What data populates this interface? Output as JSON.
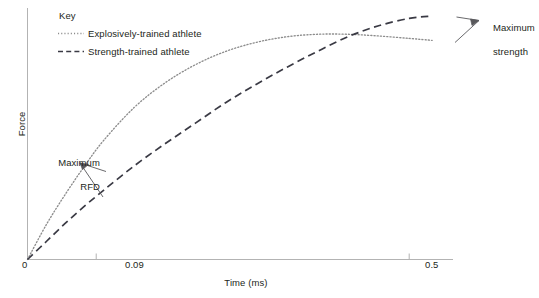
{
  "chart_data": {
    "type": "line",
    "title": "",
    "xlabel": "Time (ms)",
    "ylabel": "Force",
    "xlim": [
      0,
      0.56
    ],
    "ylim": [
      0,
      1.0
    ],
    "grid": false,
    "xticks": [
      {
        "value": 0,
        "label": "0"
      },
      {
        "value": 0.09,
        "label": "0.09"
      },
      {
        "value": 0.5,
        "label": "0.5"
      }
    ],
    "yticks": [],
    "legend": {
      "title": "Key",
      "position": "top-left",
      "entries": [
        {
          "label": "Explosively-trained athlete",
          "style": "dotted",
          "color": "#7a7a7a"
        },
        {
          "label": "Strength-trained athlete",
          "style": "dashed",
          "color": "#3a3a44"
        }
      ]
    },
    "series": [
      {
        "name": "Explosively-trained athlete",
        "style": "dotted",
        "color": "#8c8c8c",
        "x": [
          0,
          0.025,
          0.05,
          0.075,
          0.1,
          0.14,
          0.18,
          0.22,
          0.26,
          0.3,
          0.34,
          0.38,
          0.42,
          0.46,
          0.5,
          0.53
        ],
        "y": [
          0,
          0.145,
          0.27,
          0.385,
          0.49,
          0.625,
          0.725,
          0.8,
          0.855,
          0.892,
          0.915,
          0.925,
          0.925,
          0.918,
          0.908,
          0.9
        ]
      },
      {
        "name": "Strength-trained athlete",
        "style": "dashed",
        "color": "#3a3a44",
        "x": [
          0,
          0.025,
          0.05,
          0.075,
          0.1,
          0.14,
          0.18,
          0.22,
          0.26,
          0.3,
          0.34,
          0.38,
          0.42,
          0.46,
          0.5,
          0.53
        ],
        "y": [
          0,
          0.075,
          0.15,
          0.22,
          0.285,
          0.385,
          0.475,
          0.56,
          0.645,
          0.72,
          0.79,
          0.855,
          0.915,
          0.96,
          0.99,
          1.0
        ]
      }
    ],
    "annotations": [
      {
        "text": "Maximum\nRFD",
        "line1": "Maximum",
        "line2": "RFD",
        "target": "both-curves-initial-slope"
      },
      {
        "text": "Maximum\nstrength",
        "line1": "Maximum",
        "line2": "strength",
        "target": "both-curves-plateau"
      }
    ]
  },
  "axis": {
    "color": "#b3b3b3"
  }
}
